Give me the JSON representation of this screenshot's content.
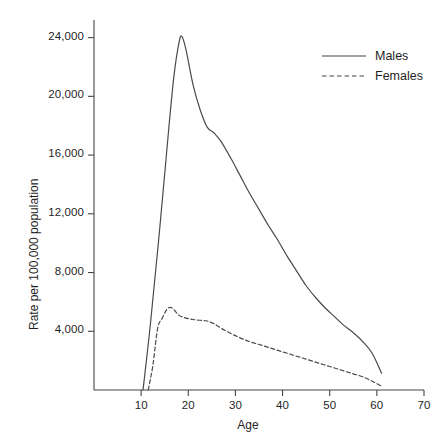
{
  "chart_data": {
    "type": "line",
    "title": "",
    "xlabel": "Age",
    "ylabel": "Rate per 100,000 population",
    "xlim": [
      0,
      70
    ],
    "ylim": [
      0,
      25200
    ],
    "grid": false,
    "legend_position": "top-right",
    "xticks": [
      "10",
      "20",
      "30",
      "40",
      "50",
      "60",
      "70"
    ],
    "xtick_values": [
      10,
      20,
      30,
      40,
      50,
      60,
      70
    ],
    "yticks": [
      "4,000",
      "8,000",
      "12,000",
      "16,000",
      "20,000",
      "24,000"
    ],
    "ytick_values": [
      4000,
      8000,
      12000,
      16000,
      20000,
      24000
    ],
    "line_color": "#4a4a4a",
    "series": [
      {
        "name": "Males",
        "style": "solid",
        "x": [
          10.4,
          12,
          14,
          16,
          17,
          18,
          18.6,
          19.5,
          21,
          22.5,
          24,
          25.5,
          27,
          29,
          31,
          33,
          35,
          37,
          39,
          41,
          43,
          45,
          47,
          49,
          51,
          53,
          55,
          57,
          59,
          61
        ],
        "values": [
          0,
          4600,
          11200,
          18300,
          21500,
          23600,
          24100,
          23200,
          20800,
          19100,
          17900,
          17500,
          16900,
          15800,
          14600,
          13400,
          12300,
          11200,
          10200,
          9100,
          8100,
          7100,
          6300,
          5600,
          5000,
          4400,
          3900,
          3300,
          2500,
          1150
        ]
      },
      {
        "name": "Females",
        "style": "dashed",
        "x": [
          11.5,
          12.5,
          13.5,
          14.5,
          15.5,
          16.5,
          18,
          19.5,
          21,
          22.5,
          24,
          25.5,
          27,
          29,
          31,
          33,
          35,
          37,
          39,
          41,
          43,
          45,
          47,
          49,
          51,
          53,
          55,
          57,
          59,
          61
        ],
        "values": [
          0,
          1700,
          4200,
          4900,
          5500,
          5600,
          5100,
          4900,
          4800,
          4750,
          4700,
          4500,
          4200,
          3850,
          3550,
          3300,
          3100,
          2900,
          2700,
          2500,
          2300,
          2100,
          1900,
          1700,
          1500,
          1300,
          1100,
          900,
          600,
          260
        ]
      }
    ]
  },
  "legend": {
    "items": [
      {
        "label": "Males",
        "style": "solid"
      },
      {
        "label": "Females",
        "style": "dashed"
      }
    ]
  }
}
